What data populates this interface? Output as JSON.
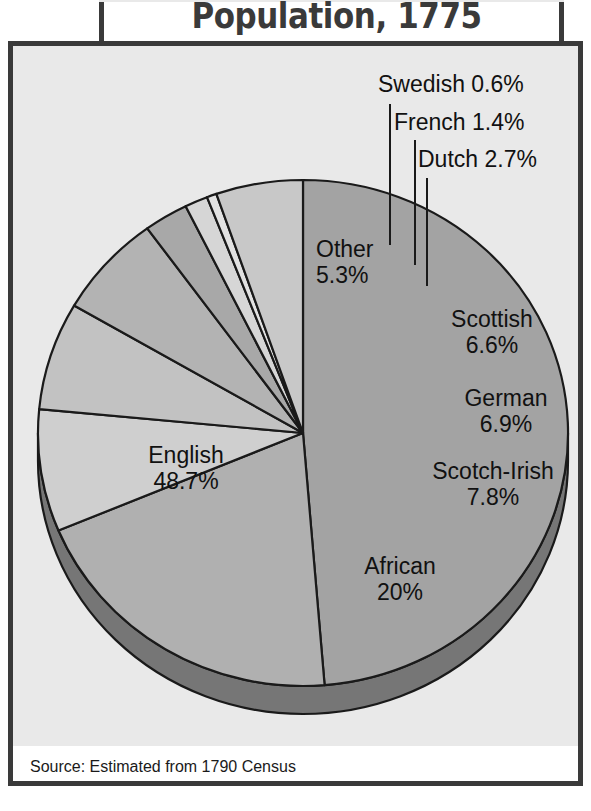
{
  "title": "Population, 1775",
  "source": "Source: Estimated from 1790 Census",
  "colors": {
    "background": "#e9e9e9",
    "frame": "#3a3a3a",
    "title_text": "#3a3a3a",
    "label_text": "#111111",
    "outline": "#1a1a1a",
    "pie_depth": "#6d6d6d"
  },
  "labels": {
    "english": {
      "name": "English",
      "value": "48.7%"
    },
    "african": {
      "name": "African",
      "value": "20%"
    },
    "scotch_irish": {
      "name": "Scotch-Irish",
      "value": "7.8%"
    },
    "german": {
      "name": "German",
      "value": "6.9%"
    },
    "scottish": {
      "name": "Scottish",
      "value": "6.6%"
    },
    "other": {
      "name": "Other",
      "value": "5.3%"
    },
    "dutch": "Dutch 2.7%",
    "french": "French 1.4%",
    "swedish": "Swedish 0.6%"
  },
  "chart_data": {
    "type": "pie",
    "title": "Population, 1775",
    "subtitle": "",
    "xlabel": "",
    "ylabel": "",
    "legend": "none",
    "grid": false,
    "note": "Source: Estimated from 1790 Census",
    "categories": [
      "English",
      "African",
      "Scotch-Irish",
      "German",
      "Scottish",
      "Dutch",
      "French",
      "Swedish",
      "Other"
    ],
    "values": [
      48.7,
      20,
      7.8,
      6.9,
      6.6,
      2.7,
      1.4,
      0.6,
      5.3
    ],
    "unit": "percent",
    "slice_colors": [
      "#a3a3a3",
      "#b0b0b0",
      "#cfcfcf",
      "#c2c2c2",
      "#b3b3b3",
      "#a8a8a8",
      "#d6d6d6",
      "#e2e2e2",
      "#c8c8c8"
    ],
    "start_angle_deg": 0,
    "direction": "clockwise",
    "total": 100.0
  }
}
